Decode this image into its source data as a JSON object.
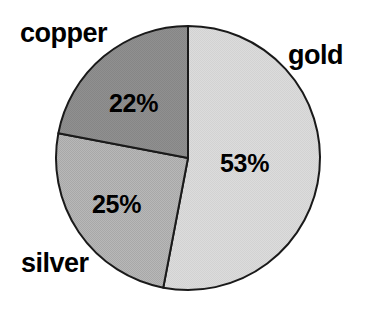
{
  "chart_data": {
    "type": "pie",
    "title": "",
    "categories": [
      "gold",
      "silver",
      "copper"
    ],
    "values": [
      53,
      25,
      22
    ],
    "value_labels": [
      "53%",
      "25%",
      "22%"
    ],
    "unit": "%",
    "start_angle_deg": 0,
    "direction": "clockwise",
    "legend": "none",
    "labels_position": "outside-callout-free",
    "background_color": "#ffffff",
    "outline_color": "#000000",
    "slices": [
      {
        "name": "gold",
        "label": "gold",
        "value": 53,
        "value_label": "53%",
        "color": "#d9d9d9"
      },
      {
        "name": "silver",
        "label": "silver",
        "value": 25,
        "value_label": "25%",
        "color": "#b3b3b3"
      },
      {
        "name": "copper",
        "label": "copper",
        "value": 22,
        "value_label": "22%",
        "color": "#8c8c8c"
      }
    ]
  }
}
